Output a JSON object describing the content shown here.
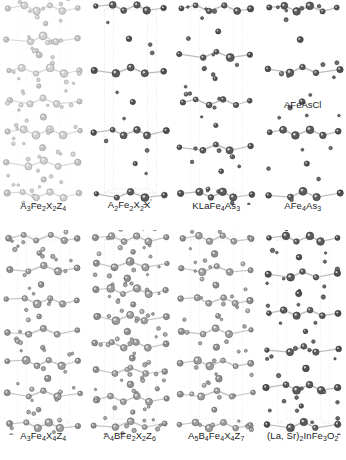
{
  "figure": {
    "background_color": "#ffffff",
    "columns": 4,
    "rows": 2,
    "width": 346,
    "height": 460
  },
  "style": {
    "bond_color": "#b9b9b9",
    "cell_line_color": "#c9c9c9",
    "atom_dark": "#4a4a4a",
    "atom_mid": "#8c8c8c",
    "atom_light": "#c2c2c2",
    "atom_outline": "#3a3a3a"
  },
  "panels": [
    {
      "id": "panel-1",
      "caption": "A3Fe2X2Z4",
      "caption_parts": [
        {
          "t": "A"
        },
        {
          "t": "3",
          "sub": true
        },
        {
          "t": "Fe"
        },
        {
          "t": "2",
          "sub": true
        },
        {
          "t": "X"
        },
        {
          "t": "2",
          "sub": true
        },
        {
          "t": "Z"
        },
        {
          "t": "4",
          "sub": true
        }
      ],
      "tone": "light",
      "seed": 11,
      "layers": 6,
      "density": "high",
      "cell_box": "faint",
      "inline_note": null
    },
    {
      "id": "panel-2",
      "caption": "A2Fe2X2X'",
      "caption_parts": [
        {
          "t": "A"
        },
        {
          "t": "2",
          "sub": true
        },
        {
          "t": "Fe"
        },
        {
          "t": "2",
          "sub": true
        },
        {
          "t": "X"
        },
        {
          "t": "2",
          "sub": true
        },
        {
          "t": "X"
        },
        {
          "t": "′",
          "prime": true
        }
      ],
      "tone": "dark",
      "seed": 23,
      "layers": 3,
      "density": "low",
      "cell_box": "strong",
      "inline_note": null
    },
    {
      "id": "panel-3",
      "caption": "KLaFe4As3",
      "caption_parts": [
        {
          "t": "KLaFe"
        },
        {
          "t": "4",
          "sub": true
        },
        {
          "t": "As"
        },
        {
          "t": "3",
          "sub": true
        }
      ],
      "tone": "dark",
      "seed": 37,
      "layers": 4,
      "density": "medium",
      "cell_box": "medium",
      "inline_note": null
    },
    {
      "id": "panel-4",
      "caption": "AFe4As3",
      "caption_parts": [
        {
          "t": "AFe"
        },
        {
          "t": "4",
          "sub": true
        },
        {
          "t": "As"
        },
        {
          "t": "3",
          "sub": true
        }
      ],
      "tone": "dark",
      "seed": 41,
      "layers": 3,
      "density": "medium",
      "cell_box": "none",
      "inline_note": {
        "text": "AFeAsCl",
        "y": 100
      }
    },
    {
      "id": "panel-5",
      "caption": "A3Fe4X4Z4",
      "caption_parts": [
        {
          "t": "A"
        },
        {
          "t": "3",
          "sub": true
        },
        {
          "t": "Fe"
        },
        {
          "t": "4",
          "sub": true
        },
        {
          "t": "X"
        },
        {
          "t": "4",
          "sub": true
        },
        {
          "t": "Z"
        },
        {
          "t": "4",
          "sub": true
        }
      ],
      "tone": "mid",
      "seed": 53,
      "layers": 6,
      "density": "medium",
      "cell_box": "medium",
      "inline_note": null
    },
    {
      "id": "panel-6",
      "caption": "A4BFe2X2Z6",
      "caption_parts": [
        {
          "t": "A"
        },
        {
          "t": "4",
          "sub": true
        },
        {
          "t": "BFe"
        },
        {
          "t": "2",
          "sub": true
        },
        {
          "t": "X"
        },
        {
          "t": "2",
          "sub": true
        },
        {
          "t": "Z"
        },
        {
          "t": "6",
          "sub": true
        }
      ],
      "tone": "mid",
      "seed": 67,
      "layers": 7,
      "density": "high",
      "cell_box": "medium",
      "inline_note": null
    },
    {
      "id": "panel-7",
      "caption": "A5B4Fe4X4Z7",
      "caption_parts": [
        {
          "t": "A"
        },
        {
          "t": "5",
          "sub": true
        },
        {
          "t": "B"
        },
        {
          "t": "4",
          "sub": true
        },
        {
          "t": "Fe"
        },
        {
          "t": "4",
          "sub": true
        },
        {
          "t": "X"
        },
        {
          "t": "4",
          "sub": true
        },
        {
          "t": "Z"
        },
        {
          "t": "7",
          "sub": true
        }
      ],
      "tone": "mid",
      "seed": 71,
      "layers": 6,
      "density": "medium",
      "cell_box": "medium",
      "inline_note": null
    },
    {
      "id": "panel-8",
      "caption": "(La, Sr)2InFe3O2",
      "caption_parts": [
        {
          "t": "(La, Sr)"
        },
        {
          "t": "2",
          "sub": true
        },
        {
          "t": "InFe"
        },
        {
          "t": "3",
          "sub": true
        },
        {
          "t": "O"
        },
        {
          "t": "2",
          "sub": true
        }
      ],
      "tone": "dark",
      "seed": 89,
      "layers": 5,
      "density": "medium",
      "cell_box": "medium",
      "inline_note": null
    }
  ]
}
